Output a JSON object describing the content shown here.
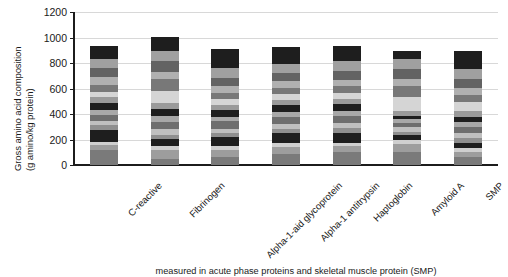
{
  "chart_data": {
    "type": "bar",
    "subtype": "stacked",
    "title": "",
    "xlabel": "",
    "ylabel": "Gross amino acid composition (g amino/kg protein)",
    "ylabel_lines": [
      "Gross amino acid composition",
      "(g amino/kg protein)"
    ],
    "ylim": [
      0,
      1200
    ],
    "yticks": [
      0,
      200,
      400,
      600,
      800,
      1000,
      1200
    ],
    "grid": true,
    "grid_axis": "y",
    "legend": false,
    "legend_position": "none",
    "categories": [
      "C-reactive",
      "Fibrinogen",
      "Alpha-1-aid glycoprotein",
      "Alpha-1 antitrypsin",
      "Haptoglobin",
      "Amyloid A",
      "SMP"
    ],
    "totals": [
      1025,
      1035,
      1005,
      1015,
      1015,
      1000,
      1010
    ],
    "series": [
      {
        "name": "segment-1",
        "color": "#7a7a7a",
        "values": [
          118,
          48,
          62,
          82,
          100,
          102,
          60
        ]
      },
      {
        "name": "segment-2",
        "color": "#9d9d9d",
        "values": [
          42,
          72,
          58,
          60,
          48,
          62,
          42
        ]
      },
      {
        "name": "segment-3",
        "color": "#cfcfcf",
        "values": [
          18,
          32,
          32,
          28,
          25,
          30,
          28
        ]
      },
      {
        "name": "segment-4",
        "color": "#1e1e1e",
        "values": [
          96,
          48,
          68,
          78,
          76,
          42,
          45
        ]
      },
      {
        "name": "segment-5",
        "color": "#8f8f8f",
        "values": [
          40,
          38,
          30,
          35,
          38,
          22,
          40
        ]
      },
      {
        "name": "segment-6",
        "color": "#bfbfbf",
        "values": [
          32,
          40,
          34,
          42,
          45,
          36,
          35
        ]
      },
      {
        "name": "segment-7",
        "color": "#6e6e6e",
        "values": [
          48,
          62,
          58,
          50,
          52,
          38,
          48
        ]
      },
      {
        "name": "segment-8",
        "color": "#a8a8a8",
        "values": [
          38,
          46,
          38,
          40,
          42,
          28,
          42
        ]
      },
      {
        "name": "segment-9",
        "color": "#1e1e1e",
        "values": [
          55,
          52,
          50,
          52,
          50,
          26,
          40
        ]
      },
      {
        "name": "segment-10",
        "color": "#9a9a9a",
        "values": [
          48,
          48,
          44,
          46,
          44,
          34,
          45
        ]
      },
      {
        "name": "segment-11",
        "color": "#d5d5d5",
        "values": [
          36,
          92,
          40,
          40,
          42,
          110,
          68
        ]
      },
      {
        "name": "segment-12",
        "color": "#787878",
        "values": [
          60,
          96,
          52,
          52,
          54,
          92,
          58
        ]
      },
      {
        "name": "segment-13",
        "color": "#b0b0b0",
        "values": [
          56,
          58,
          50,
          50,
          52,
          52,
          50
        ]
      },
      {
        "name": "segment-14",
        "color": "#636363",
        "values": [
          70,
          80,
          70,
          68,
          72,
          76,
          70
        ]
      },
      {
        "name": "segment-15",
        "color": "#a0a0a0",
        "values": [
          76,
          82,
          78,
          72,
          78,
          80,
          80
        ]
      },
      {
        "name": "segment-16",
        "color": "#1e1e1e",
        "values": [
          100,
          112,
          145,
          130,
          115,
          65,
          145
        ]
      }
    ]
  },
  "axis": {
    "y_tick_labels": [
      "0",
      "200",
      "400",
      "600",
      "800",
      "1000",
      "1200"
    ]
  },
  "caption": {
    "text": "measured in acute phase proteins and skeletal muscle protein (SMP)"
  }
}
